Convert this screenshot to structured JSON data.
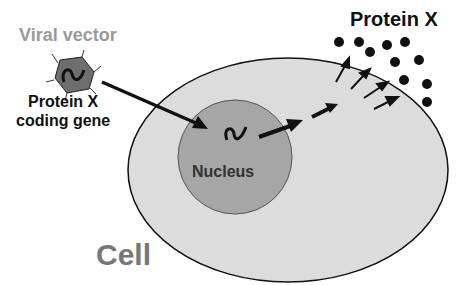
{
  "labels": {
    "viral_vector": "Viral vector",
    "gene_line1": "Protein X",
    "gene_line2": "coding gene",
    "protein": "Protein X",
    "nucleus": "Nucleus",
    "cell": "Cell"
  },
  "colors": {
    "cell_fill": "#dcdcdc",
    "nucleus_fill": "#a6a6a6",
    "virus_fill": "#6e6e6e",
    "label_gray": "#9a9a9a",
    "ink": "#111111"
  }
}
